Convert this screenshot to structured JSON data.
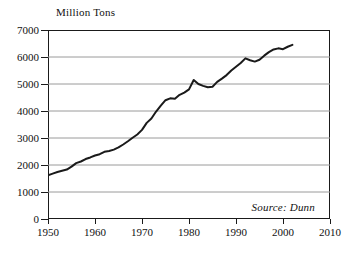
{
  "chart_data": {
    "type": "line",
    "title": "",
    "subtitle": "",
    "xlabel": "",
    "ylabel": "Million Tons",
    "xlim": [
      1950,
      2010
    ],
    "ylim": [
      0,
      7000
    ],
    "grid": "horizontal",
    "legend": "none",
    "annotations": [
      {
        "name": "source-note",
        "text": "Source: Dunn"
      }
    ],
    "x_ticks": [
      1950,
      1960,
      1970,
      1980,
      1990,
      2000,
      2010
    ],
    "x_tick_labels": [
      "1950",
      "1960",
      "1970",
      "1980",
      "1990",
      "2000",
      "2010"
    ],
    "y_ticks": [
      0,
      1000,
      2000,
      3000,
      4000,
      5000,
      6000,
      7000
    ],
    "y_tick_labels": [
      "0",
      "1000",
      "2000",
      "3000",
      "4000",
      "5000",
      "6000",
      "7000"
    ],
    "line_color": "#1a1a1a",
    "grid_color": "#9a9a9a",
    "axis_color": "#1a1a1a",
    "series": [
      {
        "name": "World grain production",
        "x": [
          1950,
          1951,
          1952,
          1953,
          1954,
          1955,
          1956,
          1957,
          1958,
          1959,
          1960,
          1961,
          1962,
          1963,
          1964,
          1965,
          1966,
          1967,
          1968,
          1969,
          1970,
          1971,
          1972,
          1973,
          1974,
          1975,
          1976,
          1977,
          1978,
          1979,
          1980,
          1981,
          1982,
          1983,
          1984,
          1985,
          1986,
          1987,
          1988,
          1989,
          1990,
          1991,
          1992,
          1993,
          1994,
          1995,
          1996,
          1997,
          1998,
          1999,
          2000,
          2001,
          2002
        ],
        "values": [
          1620,
          1680,
          1740,
          1790,
          1830,
          1940,
          2070,
          2130,
          2220,
          2280,
          2350,
          2400,
          2490,
          2520,
          2570,
          2650,
          2760,
          2880,
          3010,
          3130,
          3300,
          3560,
          3720,
          3980,
          4200,
          4400,
          4470,
          4450,
          4600,
          4680,
          4800,
          5150,
          5000,
          4930,
          4880,
          4900,
          5080,
          5200,
          5330,
          5500,
          5640,
          5780,
          5950,
          5880,
          5830,
          5900,
          6050,
          6180,
          6280,
          6320,
          6290,
          6380,
          6450
        ]
      }
    ]
  }
}
